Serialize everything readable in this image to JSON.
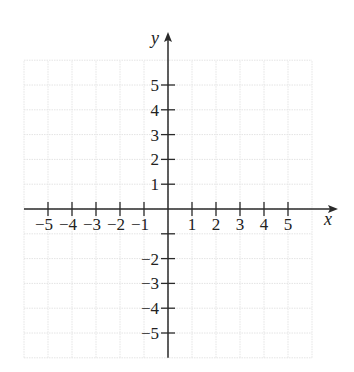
{
  "chart_data": {
    "type": "scatter",
    "title": "",
    "xlabel": "x",
    "ylabel": "y",
    "xlim": [
      -6,
      6
    ],
    "ylim": [
      -6,
      6
    ],
    "grid": true,
    "x_ticks": [
      -5,
      -4,
      -3,
      -2,
      -1,
      1,
      2,
      3,
      4,
      5
    ],
    "x_tick_labels": [
      "−5",
      "−4",
      "−3",
      "−2",
      "−1",
      "1",
      "2",
      "3",
      "4",
      "5"
    ],
    "y_ticks": [
      5,
      4,
      3,
      2,
      1,
      -1,
      -2,
      -3,
      -4,
      -5
    ],
    "y_tick_labels": [
      "5",
      "4",
      "3",
      "2",
      "1",
      "",
      "−2",
      "−3",
      "−4",
      "−5"
    ],
    "series": []
  },
  "colors": {
    "axis": "#2a2a2a",
    "grid": "#e4e4e4",
    "text": "#222222"
  }
}
